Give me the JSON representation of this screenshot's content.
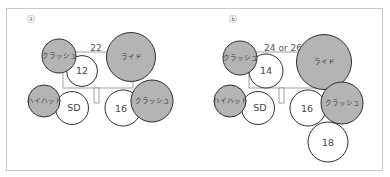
{
  "diagram": {
    "type": "drum kit setup (top view)",
    "colors": {
      "cymbal_fill": "#b4b4b4",
      "cymbal_stroke": "#2e2e2e",
      "drum_fill": "#ffffff",
      "drum_stroke": "#2e2e2e",
      "frame": "#c8c8c8",
      "kick_outline": "#8a8a8a"
    },
    "panels": [
      {
        "id": "a",
        "label": "ⓐ",
        "bass_drum_size": "22",
        "items": [
          {
            "name": "crash-left",
            "label": "クラッシュ",
            "kind": "cymbal"
          },
          {
            "name": "tom-12",
            "label": "12",
            "kind": "drum"
          },
          {
            "name": "ride",
            "label": "ライド",
            "kind": "cymbal"
          },
          {
            "name": "hihat",
            "label": "ハイハット",
            "kind": "cymbal"
          },
          {
            "name": "snare",
            "label": "SD",
            "kind": "drum"
          },
          {
            "name": "floor-tom-16",
            "label": "16",
            "kind": "drum"
          },
          {
            "name": "crash-right",
            "label": "クラッシュ",
            "kind": "cymbal"
          }
        ]
      },
      {
        "id": "b",
        "label": "ⓑ",
        "bass_drum_size": "24 or 26",
        "items": [
          {
            "name": "crash-left",
            "label": "クラッシュ",
            "kind": "cymbal"
          },
          {
            "name": "tom-14",
            "label": "14",
            "kind": "drum"
          },
          {
            "name": "ride",
            "label": "ライド",
            "kind": "cymbal"
          },
          {
            "name": "hihat",
            "label": "ハイハット",
            "kind": "cymbal"
          },
          {
            "name": "snare",
            "label": "SD",
            "kind": "drum"
          },
          {
            "name": "floor-tom-16",
            "label": "16",
            "kind": "drum"
          },
          {
            "name": "crash-right",
            "label": "クラッシュ",
            "kind": "cymbal"
          },
          {
            "name": "floor-tom-18",
            "label": "18",
            "kind": "drum"
          }
        ]
      }
    ]
  }
}
